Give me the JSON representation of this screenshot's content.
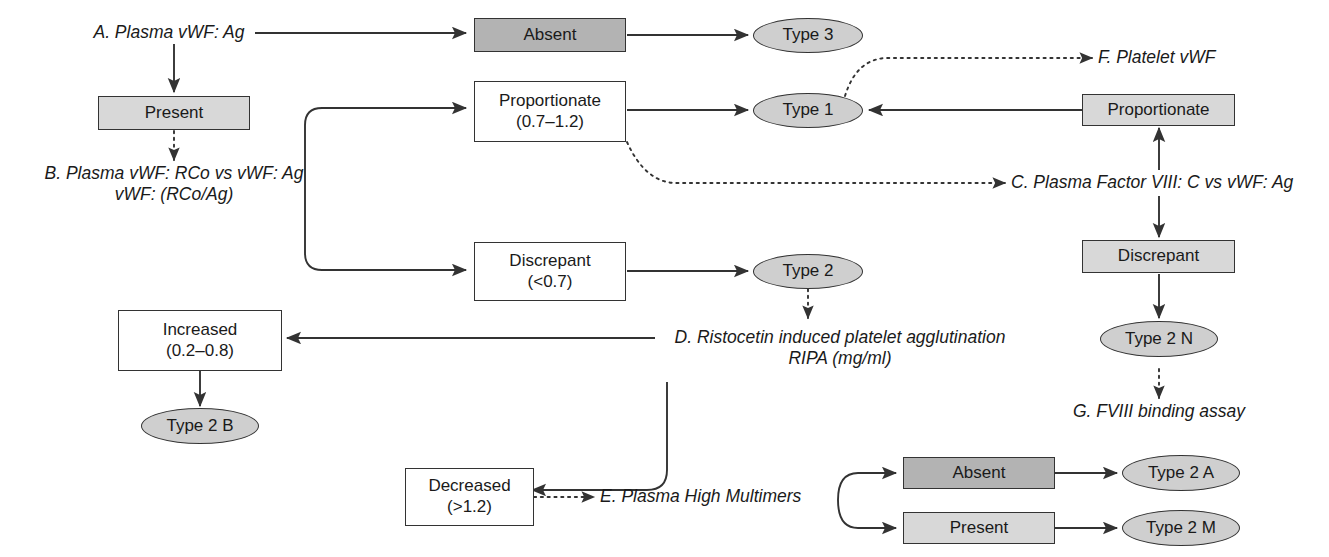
{
  "diagram": {
    "type": "flowchart",
    "colors": {
      "stroke": "#333333",
      "box_fill_light": "#d8d8d8",
      "box_fill_dark": "#b3b3b3",
      "ellipse_fill": "#cfcfcf",
      "background": "#ffffff",
      "text": "#1a1a1a"
    }
  },
  "labels": {
    "a_plasma_vwf_ag": "A. Plasma vWF: Ag",
    "b_line1": "B. Plasma vWF: RCo vs vWF: Ag",
    "b_line2": "vWF: (RCo/Ag)",
    "c_plasma_factor": "C. Plasma Factor VIII: C vs vWF: Ag",
    "d_line1": "D. Ristocetin induced platelet agglutination",
    "d_line2": "RIPA (mg/ml)",
    "e_plasma_high_multimers": "E. Plasma High Multimers",
    "f_platelet_vwf": "F. Platelet vWF",
    "g_fviii_binding_assay": "G. FVIII binding assay"
  },
  "boxes": {
    "absent_top": {
      "label": "Absent",
      "shade": "dark"
    },
    "present_left": {
      "label": "Present",
      "shade": "light"
    },
    "proportionate_mid": {
      "label": "Proportionate",
      "value": "(0.7–1.2)",
      "shade": "none"
    },
    "discrepant_mid": {
      "label": "Discrepant",
      "value": "(<0.7)",
      "shade": "none"
    },
    "increased": {
      "label": "Increased",
      "value": "(0.2–0.8)",
      "shade": "none"
    },
    "decreased": {
      "label": "Decreased",
      "value": "(>1.2)",
      "shade": "none"
    },
    "proportionate_right": {
      "label": "Proportionate",
      "shade": "light"
    },
    "discrepant_right": {
      "label": "Discrepant",
      "shade": "light"
    },
    "absent_bottom": {
      "label": "Absent",
      "shade": "dark"
    },
    "present_bottom": {
      "label": "Present",
      "shade": "light"
    }
  },
  "outcomes": {
    "type_3": "Type 3",
    "type_1": "Type 1",
    "type_2": "Type 2",
    "type_2_b": "Type 2 B",
    "type_2_n": "Type 2 N",
    "type_2_a": "Type 2 A",
    "type_2_m": "Type 2 M"
  }
}
